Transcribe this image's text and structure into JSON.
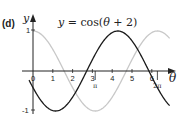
{
  "panel_label": "(d)",
  "chart_data": {
    "type": "line",
    "title": "y = cos(θ + 2)",
    "xlabel": "θ",
    "ylabel": "y",
    "xlim": [
      -0.2,
      6.9
    ],
    "ylim": [
      -1.1,
      1.15
    ],
    "x_ticks": [
      "0",
      "1",
      "2",
      "3",
      "4",
      "5",
      "6"
    ],
    "x_special_ticks": [
      {
        "label": "π",
        "value": 3.1416
      },
      {
        "label": "2π",
        "value": 6.2832
      }
    ],
    "y_ticks": [
      "1",
      "-1"
    ],
    "grid": false,
    "series": [
      {
        "name": "y = cos(θ + 2)",
        "function": "cos(theta + 2)",
        "color": "#000000",
        "x_range": [
          -0.2,
          6.9
        ]
      },
      {
        "name": "y = cos(θ)",
        "function": "cos(theta)",
        "color": "#c8c8c8",
        "x_range": [
          0,
          6.9
        ]
      }
    ],
    "annotations": [
      {
        "text": "y = cos(θ + 2)",
        "position": "top-center"
      }
    ]
  },
  "labels": {
    "theta": "θ",
    "y": "y",
    "one": "1",
    "minus_one": "-1",
    "pi": "π",
    "two_pi": "2π",
    "title": "y = cos(θ + 2)",
    "t0": "0",
    "t1": "1",
    "t2": "2",
    "t3": "3",
    "t4": "4",
    "t5": "5",
    "t6": "6"
  }
}
